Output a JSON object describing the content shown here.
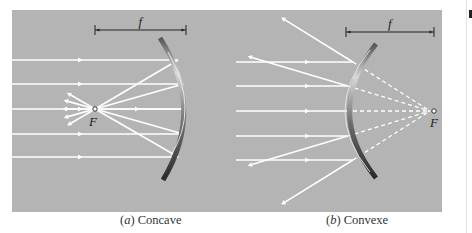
{
  "figure": {
    "background_color": "#b4b4b4",
    "ray_color": "#ffffff",
    "panels": [
      {
        "id": "a",
        "caption_letter": "a",
        "caption_text": " Concave",
        "focal_label": "F",
        "focal_length_label": "f",
        "mirror_type": "concave",
        "ray_count": 5
      },
      {
        "id": "b",
        "caption_letter": "b",
        "caption_text": " Convexe",
        "focal_label": "F",
        "focal_length_label": "f",
        "mirror_type": "convex",
        "ray_count": 5
      }
    ]
  }
}
